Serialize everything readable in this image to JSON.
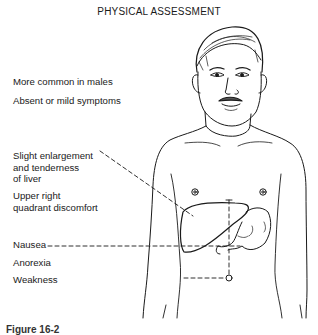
{
  "header": {
    "title": "PHYSICAL ASSESSMENT"
  },
  "labels": [
    {
      "id": "males",
      "text": "More common in males"
    },
    {
      "id": "symptoms",
      "text": "Absent or mild symptoms"
    },
    {
      "id": "liver",
      "lines": [
        "Slight enlargement",
        "and tenderness",
        "of liver"
      ]
    },
    {
      "id": "quadrant",
      "lines": [
        "Upper right",
        "quadrant discomfort"
      ]
    },
    {
      "id": "nausea",
      "text": "Nausea"
    },
    {
      "id": "anorexia",
      "text": "Anorexia"
    },
    {
      "id": "weakness",
      "text": "Weakness"
    }
  ],
  "figure": {
    "organs": [
      "liver",
      "stomach",
      "umbilicus"
    ],
    "line_color": "#1a1a1a"
  },
  "caption": {
    "text": "Figure 16-2"
  }
}
